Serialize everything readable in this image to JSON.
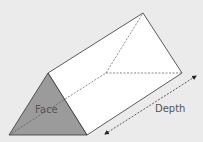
{
  "diagram": {
    "labels": {
      "face": "Face",
      "depth": "Depth"
    },
    "colors": {
      "background": "#ebebeb",
      "face_fill": "#9b9b9b",
      "side_fill": "#ffffff",
      "edge": "#333333",
      "hidden_edge": "#555555"
    }
  }
}
